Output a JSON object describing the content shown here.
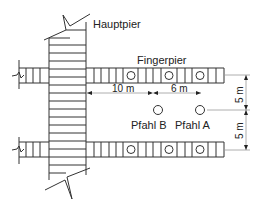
{
  "diagram": {
    "labels": {
      "main_pier": "Hauptpier",
      "finger_pier": "Fingerpier",
      "pile_b": "Pfahl B",
      "pile_a": "Pfahl A"
    },
    "dimensions": {
      "horizontal_1": "10 m",
      "horizontal_2": "6 m",
      "vertical_upper": "5 m",
      "vertical_lower": "5 m"
    },
    "colors": {
      "line": "#333333",
      "dim_line": "#999999",
      "text": "#222222",
      "background": "#ffffff"
    }
  }
}
